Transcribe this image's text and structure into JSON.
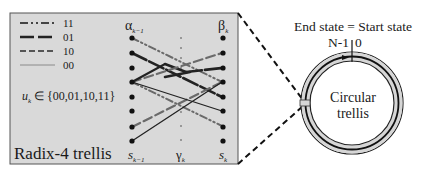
{
  "legend": {
    "items": [
      {
        "label": "11",
        "style": "dash-dot-dot"
      },
      {
        "label": "01",
        "style": "long-dash"
      },
      {
        "label": "10",
        "style": "dash"
      },
      {
        "label": "00",
        "style": "thin-solid"
      }
    ]
  },
  "trellis": {
    "title": "Radix-4 trellis",
    "input_set": "u_k ∈ {00,01,10,11}",
    "input_set_parts": {
      "var": "u",
      "sub": "k",
      "rest": " ∈ {00,01,10,11}"
    },
    "alpha_label": {
      "sym": "α",
      "sub": "k−1"
    },
    "beta_label": {
      "sym": "β",
      "sub": "k"
    },
    "left_state_label": {
      "sym": "s",
      "sub": "k−1"
    },
    "gamma_label": {
      "sym": "γ",
      "sub": "k"
    },
    "right_state_label": {
      "sym": "s",
      "sub": "k"
    },
    "num_states": 8
  },
  "circular": {
    "top_label": "End state = Start state",
    "left_index": "N-1",
    "right_index": "0",
    "center_line1": "Circular",
    "center_line2": "trellis"
  },
  "colors": {
    "box_bg": "#d9d9d9",
    "line_dark": "#222222",
    "line_gray": "#6e6e6e",
    "ring_band": "#d6d6d6"
  }
}
